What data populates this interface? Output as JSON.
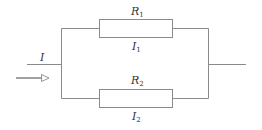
{
  "diagram": {
    "type": "parallel-resistor-circuit",
    "colors": {
      "wire": "#8a8a8a",
      "text": "#333333",
      "background": "#ffffff"
    },
    "input": {
      "current_label": "I",
      "arrow": "hollow-arrow-right"
    },
    "branches": [
      {
        "resistor_label": "R",
        "resistor_sub": "1",
        "current_label": "I",
        "current_sub": "1"
      },
      {
        "resistor_label": "R",
        "resistor_sub": "2",
        "current_label": "I",
        "current_sub": "2"
      }
    ]
  }
}
